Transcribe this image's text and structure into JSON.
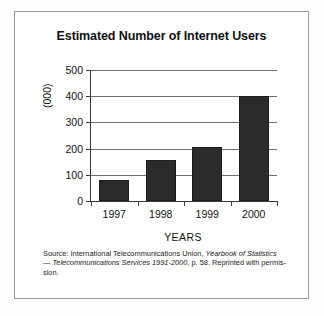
{
  "figure": {
    "title": "Estimated Number of Internet Users",
    "source_note": {
      "line1_prefix": "Source: International Telecommunications Union, ",
      "line1_italic": "Yearbook of Statistics",
      "line2_prefix": "— ",
      "line2_italic": "Telecommunications Services 1991-2000",
      "line2_suffix": ", p. 58. Reprinted with permis-",
      "line3": "sion."
    }
  },
  "chart_data": {
    "type": "bar",
    "title": "Estimated Number of Internet Users",
    "categories": [
      "1997",
      "1998",
      "1999",
      "2000"
    ],
    "values": [
      80,
      155,
      205,
      400
    ],
    "xlabel": "YEARS",
    "ylabel": "(000)",
    "ylim": [
      0,
      500
    ],
    "ytick_labels": [
      "0",
      "100",
      "200",
      "300",
      "400",
      "500"
    ],
    "ytick_values": [
      0,
      100,
      200,
      300,
      400,
      500
    ],
    "grid": true,
    "legend": "none",
    "bar_color": "#2b2b2b",
    "axis_color": "#3a3a3a",
    "grid_color": "#6e6e6e"
  }
}
